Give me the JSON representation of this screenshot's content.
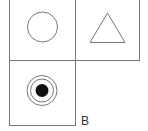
{
  "diagram": {
    "cells": [
      {
        "position": "top-left",
        "shape": "circle"
      },
      {
        "position": "top-right",
        "shape": "triangle"
      },
      {
        "position": "bottom-left",
        "shape": "concentric-target"
      }
    ],
    "label": "B",
    "colors": {
      "stroke": "#666666",
      "fill": "#111111",
      "background": "#ffffff"
    }
  }
}
